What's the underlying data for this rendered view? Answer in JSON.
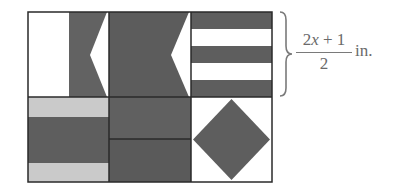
{
  "figure": {
    "colors": {
      "dark": "#5e5e5e",
      "light_gray": "#c9c9c9",
      "white": "#ffffff",
      "border": "#2a2a2a",
      "text": "#6a6a6a"
    },
    "grid": {
      "rows": 2,
      "cols": 3
    },
    "cells": [
      {
        "pos": "row1-col1",
        "pattern": "white left half, dark right half with white left-pointing notch"
      },
      {
        "pos": "row1-col2",
        "pattern": "dark with white left-pointing notch on right edge"
      },
      {
        "pos": "row1-col3",
        "pattern": "five horizontal stripes dark/white/dark/white/dark"
      },
      {
        "pos": "row2-col1",
        "pattern": "light gray / dark / light gray horizontal bands"
      },
      {
        "pos": "row2-col2",
        "pattern": "two dark horizontal halves"
      },
      {
        "pos": "row2-col3",
        "pattern": "white with dark diamond"
      }
    ],
    "dimension_label": {
      "numerator_pre": "2",
      "numerator_var": "x",
      "numerator_post": " + 1",
      "denominator": "2",
      "unit": "in."
    }
  }
}
